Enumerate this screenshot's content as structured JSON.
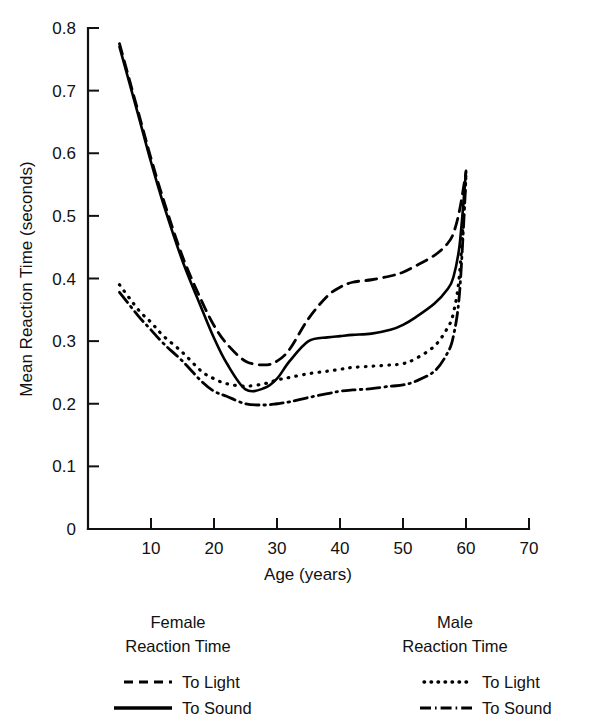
{
  "chart_data": {
    "type": "line",
    "title": "",
    "xlabel": "Age (years)",
    "ylabel": "Mean Reaction Time (seconds)",
    "xlim": [
      0,
      70
    ],
    "ylim": [
      0,
      0.8
    ],
    "xticks": [
      "10",
      "20",
      "30",
      "40",
      "50",
      "60",
      "70"
    ],
    "xtick_values": [
      10,
      20,
      30,
      40,
      50,
      60,
      70
    ],
    "yticks": [
      "0",
      "0.1",
      "0.2",
      "0.3",
      "0.4",
      "0.5",
      "0.6",
      "0.7",
      "0.8"
    ],
    "ytick_values": [
      0,
      0.1,
      0.2,
      0.3,
      0.4,
      0.5,
      0.6,
      0.7,
      0.8
    ],
    "grid": false,
    "legend_position": "below-axes",
    "x": [
      5,
      8,
      10,
      12,
      15,
      18,
      20,
      22,
      25,
      28,
      30,
      32,
      35,
      38,
      40,
      42,
      45,
      48,
      50,
      52,
      55,
      57,
      58,
      59,
      60
    ],
    "series": [
      {
        "name": "Female Reaction Time To Light",
        "group": "Female",
        "stimulus": "To Light",
        "style": "dashed",
        "values": [
          0.775,
          0.665,
          0.592,
          0.525,
          0.435,
          0.365,
          0.325,
          0.296,
          0.268,
          0.262,
          0.268,
          0.287,
          0.336,
          0.372,
          0.386,
          0.394,
          0.398,
          0.404,
          0.41,
          0.42,
          0.437,
          0.455,
          0.472,
          0.51,
          0.57
        ]
      },
      {
        "name": "Female Reaction Time To Sound",
        "group": "Female",
        "stimulus": "To Sound",
        "style": "solid",
        "values": [
          0.77,
          0.66,
          0.586,
          0.518,
          0.428,
          0.353,
          0.305,
          0.265,
          0.223,
          0.225,
          0.24,
          0.268,
          0.3,
          0.306,
          0.308,
          0.31,
          0.312,
          0.318,
          0.326,
          0.338,
          0.36,
          0.382,
          0.402,
          0.455,
          0.572
        ]
      },
      {
        "name": "Male Reaction Time To Light",
        "group": "Male",
        "stimulus": "To Light",
        "style": "dotted",
        "values": [
          0.39,
          0.35,
          0.33,
          0.308,
          0.282,
          0.252,
          0.24,
          0.232,
          0.228,
          0.232,
          0.238,
          0.242,
          0.248,
          0.252,
          0.255,
          0.258,
          0.26,
          0.262,
          0.264,
          0.272,
          0.292,
          0.32,
          0.345,
          0.41,
          0.568
        ]
      },
      {
        "name": "Male Reaction Time To Sound",
        "group": "Male",
        "stimulus": "To Sound",
        "style": "dashdot",
        "values": [
          0.378,
          0.34,
          0.318,
          0.296,
          0.268,
          0.236,
          0.22,
          0.212,
          0.2,
          0.198,
          0.2,
          0.203,
          0.21,
          0.216,
          0.22,
          0.222,
          0.224,
          0.228,
          0.23,
          0.236,
          0.252,
          0.28,
          0.308,
          0.38,
          0.56
        ]
      }
    ],
    "annotations": []
  },
  "legend": {
    "female": {
      "title_line1": "Female",
      "title_line2": "Reaction Time",
      "entries": [
        {
          "style": "dashed",
          "label": "To Light"
        },
        {
          "style": "solid",
          "label": "To Sound"
        }
      ]
    },
    "male": {
      "title_line1": "Male",
      "title_line2": "Reaction Time",
      "entries": [
        {
          "style": "dotted",
          "label": "To Light"
        },
        {
          "style": "dashdot",
          "label": "To Sound"
        }
      ]
    }
  },
  "colors": {
    "ink": "#111111",
    "background": "#ffffff"
  }
}
